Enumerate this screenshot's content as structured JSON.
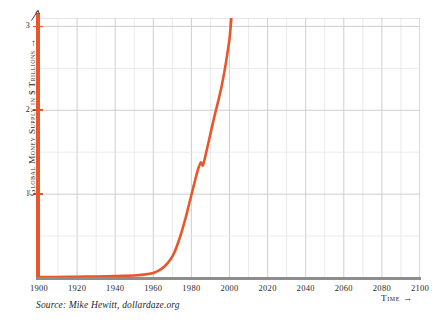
{
  "chart_data": {
    "type": "line",
    "title": "",
    "xlabel": "Time",
    "ylabel": "Global Money Supply in $ Trillions",
    "xlim": [
      1900,
      2100
    ],
    "ylim": [
      0,
      3.1
    ],
    "grid": true,
    "legend": false,
    "line_color": "#e8562c",
    "x_ticks": [
      1900,
      1920,
      1940,
      1960,
      1980,
      2000,
      2020,
      2040,
      2060,
      2080,
      2100
    ],
    "x_tick_labels": [
      "1900",
      "1920",
      "1940",
      "1960",
      "1980",
      "2000",
      "2020",
      "2040",
      "2060",
      "2080",
      "2100"
    ],
    "y_ticks": [
      1,
      2,
      3
    ],
    "y_tick_labels": [
      "1",
      "2",
      "3"
    ],
    "y_minor_gridlines": [
      0.5,
      1.5,
      2.5
    ],
    "x_minor_gridline_step": 10,
    "series": [
      {
        "name": "Global Money Supply",
        "x": [
          1900,
          1910,
          1920,
          1930,
          1940,
          1950,
          1955,
          1960,
          1963,
          1966,
          1969,
          1971,
          1973,
          1975,
          1977,
          1979,
          1981,
          1983,
          1984,
          1985,
          1986,
          1987,
          1988,
          1990,
          1992,
          1994,
          1996,
          1998,
          2000,
          2001
        ],
        "y": [
          0.01,
          0.012,
          0.015,
          0.018,
          0.022,
          0.03,
          0.04,
          0.06,
          0.09,
          0.14,
          0.22,
          0.3,
          0.42,
          0.56,
          0.72,
          0.9,
          1.08,
          1.26,
          1.33,
          1.38,
          1.34,
          1.42,
          1.52,
          1.72,
          1.92,
          2.1,
          2.3,
          2.55,
          2.85,
          3.1
        ]
      }
    ]
  },
  "axis": {
    "y_title": "Global Money Supply in $ Trillions",
    "x_title": "Time",
    "arrow_glyph": "⟶"
  },
  "source": {
    "note": "Source: Mike Hewitt, dollardaze.org"
  }
}
